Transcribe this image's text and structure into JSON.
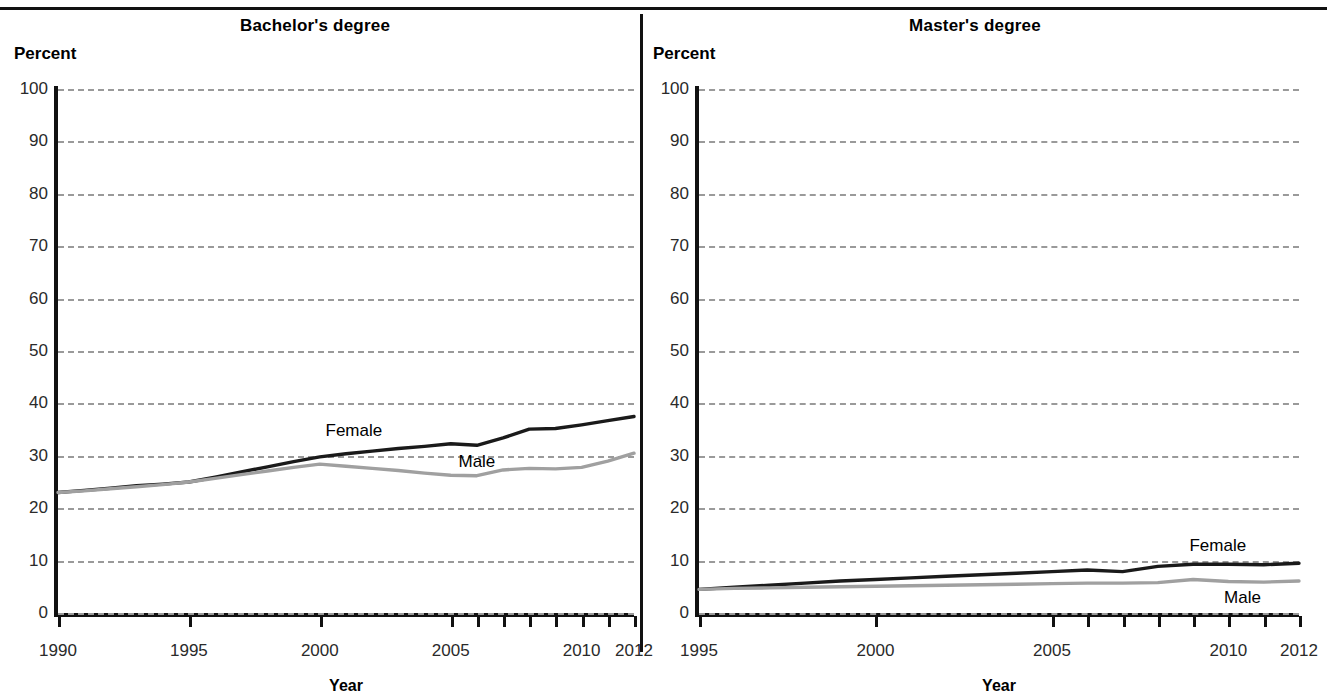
{
  "figure": {
    "xaxis_title": "Year",
    "yaxis_label": "Percent"
  },
  "panels": {
    "bachelors": {
      "title": "Bachelor's degree",
      "percent_label": "Percent",
      "xaxis_title": "Year",
      "ytick_labels": [
        "0",
        "10",
        "20",
        "30",
        "40",
        "50",
        "60",
        "70",
        "80",
        "90",
        "100"
      ],
      "xtick_labels": [
        "1990",
        "1995",
        "2000",
        "2005",
        "2010",
        "2012"
      ],
      "series_labels": {
        "female": "Female",
        "male": "Male"
      }
    },
    "masters": {
      "title": "Master's degree",
      "percent_label": "Percent",
      "xaxis_title": "Year",
      "ytick_labels": [
        "0",
        "10",
        "20",
        "30",
        "40",
        "50",
        "60",
        "70",
        "80",
        "90",
        "100"
      ],
      "xtick_labels": [
        "1995",
        "2000",
        "2005",
        "2010",
        "2012"
      ],
      "series_labels": {
        "female": "Female",
        "male": "Male"
      }
    }
  },
  "chart_data": [
    {
      "type": "line",
      "title": "Bachelor's degree",
      "xlabel": "Year",
      "ylabel": "Percent",
      "xlim": [
        1990,
        2012
      ],
      "ylim": [
        0,
        100
      ],
      "ytick_values": [
        0,
        10,
        20,
        30,
        40,
        50,
        60,
        70,
        80,
        90,
        100
      ],
      "xtick_values": [
        1990,
        1995,
        2000,
        2005,
        2010,
        2012
      ],
      "grid": true,
      "legend": "inline-labels",
      "x": [
        1990,
        1991,
        1992,
        1993,
        1994,
        1995,
        1996,
        1997,
        1998,
        1999,
        2000,
        2001,
        2002,
        2003,
        2004,
        2005,
        2006,
        2007,
        2008,
        2009,
        2010,
        2011,
        2012
      ],
      "series": [
        {
          "name": "Female",
          "color": "#1a1a1a",
          "values": [
            23.0,
            23.4,
            23.8,
            24.3,
            24.6,
            25.0,
            25.9,
            26.9,
            27.9,
            28.9,
            29.8,
            30.4,
            30.9,
            31.4,
            31.8,
            32.3,
            32.0,
            33.4,
            35.1,
            35.2,
            35.9,
            36.7,
            37.5
          ]
        },
        {
          "name": "Male",
          "color": "#a0a0a0",
          "values": [
            23.0,
            23.3,
            23.7,
            24.1,
            24.5,
            25.0,
            25.7,
            26.4,
            27.1,
            27.8,
            28.4,
            28.0,
            27.6,
            27.2,
            26.7,
            26.3,
            26.2,
            27.3,
            27.6,
            27.5,
            27.8,
            29.0,
            30.5
          ]
        }
      ]
    },
    {
      "type": "line",
      "title": "Master's degree",
      "xlabel": "Year",
      "ylabel": "Percent",
      "xlim": [
        1995,
        2012
      ],
      "ylim": [
        0,
        100
      ],
      "ytick_values": [
        0,
        10,
        20,
        30,
        40,
        50,
        60,
        70,
        80,
        90,
        100
      ],
      "xtick_values": [
        1995,
        2000,
        2005,
        2010,
        2012
      ],
      "grid": true,
      "legend": "inline-labels",
      "x": [
        1995,
        1996,
        1997,
        1998,
        1999,
        2000,
        2001,
        2002,
        2003,
        2004,
        2005,
        2006,
        2007,
        2008,
        2009,
        2010,
        2011,
        2012
      ],
      "series": [
        {
          "name": "Female",
          "color": "#1a1a1a",
          "values": [
            4.5,
            4.9,
            5.3,
            5.7,
            6.1,
            6.4,
            6.7,
            7.0,
            7.3,
            7.6,
            7.9,
            8.2,
            7.9,
            8.9,
            9.3,
            9.3,
            9.2,
            9.5
          ]
        },
        {
          "name": "Male",
          "color": "#a0a0a0",
          "values": [
            4.5,
            4.7,
            4.8,
            4.9,
            5.0,
            5.1,
            5.2,
            5.3,
            5.4,
            5.5,
            5.6,
            5.7,
            5.7,
            5.8,
            6.4,
            6.0,
            5.9,
            6.1
          ]
        }
      ]
    }
  ]
}
